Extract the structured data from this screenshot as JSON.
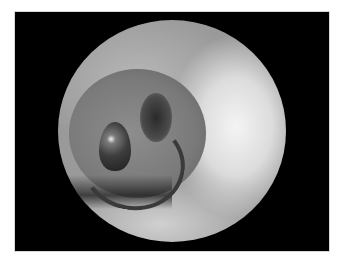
{
  "image": {
    "description": "Grayscale endoscopic circular view inside a black rectangular frame",
    "frame_color": "#000000",
    "background_color": "#ffffff",
    "features": [
      "circular-scope-view",
      "lumen-fold",
      "dark-balloon-object",
      "catheter-ring",
      "bright-wall-highlight"
    ]
  }
}
